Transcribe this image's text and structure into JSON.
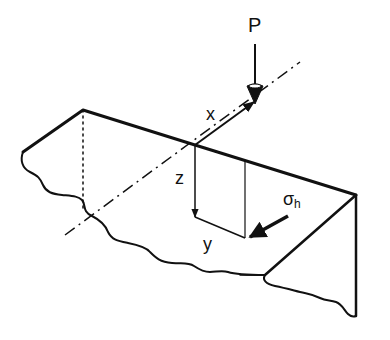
{
  "figure": {
    "labels": {
      "load": "P",
      "x_axis": "x",
      "z_axis": "z",
      "y_axis": "y",
      "stress_symbol": "σ",
      "stress_subscript": "h"
    },
    "colors": {
      "line": "#111111",
      "background": "#ffffff"
    }
  }
}
